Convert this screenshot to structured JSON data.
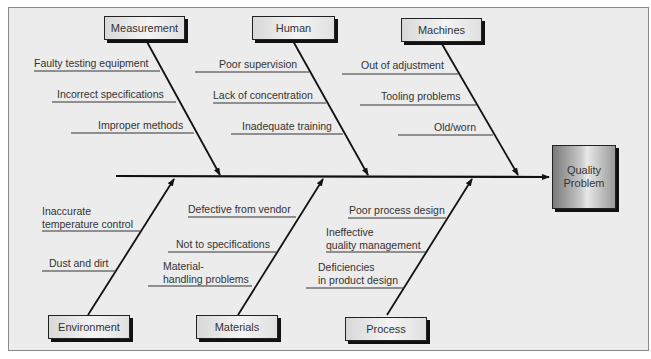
{
  "diagram": {
    "type": "fishbone (cause-and-effect)",
    "effect": {
      "line1": "Quality",
      "line2": "Problem"
    },
    "categories_top": [
      {
        "label": "Measurement",
        "causes": [
          "Faulty testing equipment",
          "Incorrect specifications",
          "Improper methods"
        ]
      },
      {
        "label": "Human",
        "causes": [
          "Poor supervision",
          "Lack of concentration",
          "Inadequate training"
        ]
      },
      {
        "label": "Machines",
        "causes": [
          "Out of adjustment",
          "Tooling problems",
          "Old/worn"
        ]
      }
    ],
    "categories_bottom": [
      {
        "label": "Environment",
        "causes": [
          {
            "l1": "Inaccurate",
            "l2": "temperature control"
          },
          {
            "l1": "Dust and dirt",
            "l2": ""
          }
        ]
      },
      {
        "label": "Materials",
        "causes": [
          {
            "l1": "Defective from vendor",
            "l2": ""
          },
          {
            "l1": "Not to specifications",
            "l2": ""
          },
          {
            "l1": "Material-",
            "l2": "handling problems"
          }
        ]
      },
      {
        "label": "Process",
        "causes": [
          {
            "l1": "Poor process design",
            "l2": ""
          },
          {
            "l1": "Ineffective",
            "l2": "quality management"
          },
          {
            "l1": "Deficiencies",
            "l2": "in product design"
          }
        ]
      }
    ]
  }
}
